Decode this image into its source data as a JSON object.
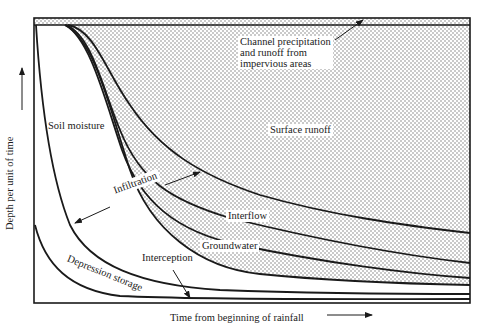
{
  "diagram": {
    "axes": {
      "x_label": "Time from beginning of rainfall",
      "y_label": "Depth per unit of time"
    },
    "regions": {
      "channel": "Channel precipitation",
      "channel_line2": "and runoff from",
      "channel_line3": "impervious areas",
      "surface_runoff": "Surface runoff",
      "soil_moisture": "Soil moisture",
      "infiltration": "Infiltration",
      "interflow": "Interflow",
      "groundwater": "Groundwater",
      "interception": "Interception",
      "depression_storage": "Depression storage"
    },
    "colors": {
      "ink": "#1a1a1a",
      "stipple": "#8a8a8a",
      "background": "#ffffff"
    }
  }
}
